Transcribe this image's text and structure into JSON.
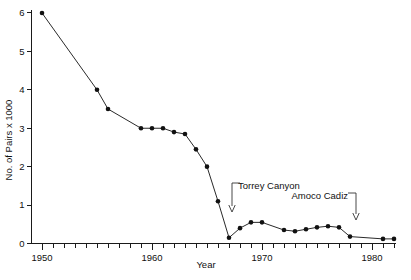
{
  "chart_data": {
    "type": "line",
    "title": "",
    "xlabel": "Year",
    "ylabel": "No. of Pairs x 1000",
    "xlim": [
      1949,
      1982.5
    ],
    "ylim": [
      0,
      6.2
    ],
    "grid": false,
    "legend": "none",
    "x_ticks_major": [
      1950,
      1960,
      1970,
      1980
    ],
    "x_tick_labels": [
      "1950",
      "1960",
      "1970",
      "1980"
    ],
    "x_tick_minor_step": 1,
    "y_ticks": [
      0,
      1,
      2,
      3,
      4,
      5,
      6
    ],
    "y_tick_labels": [
      "0",
      "1",
      "2",
      "3",
      "4",
      "5",
      "6"
    ],
    "series": [
      {
        "name": "Number of pairs",
        "marker": "filled-circle",
        "x": [
          1950,
          1955,
          1956,
          1959,
          1960,
          1961,
          1962,
          1963,
          1964,
          1965,
          1966,
          1967,
          1968,
          1969,
          1970,
          1972,
          1973,
          1974,
          1975,
          1976,
          1977,
          1978,
          1981,
          1982
        ],
        "y": [
          6.0,
          4.0,
          3.5,
          3.0,
          3.0,
          3.0,
          2.9,
          2.85,
          2.45,
          2.0,
          1.1,
          0.15,
          0.4,
          0.55,
          0.55,
          0.35,
          0.32,
          0.37,
          0.42,
          0.45,
          0.42,
          0.18,
          0.12,
          0.12
        ]
      }
    ],
    "annotations": [
      {
        "id": "torrey-canyon",
        "label": "Torrey Canyon",
        "target_year": 1967,
        "text_x": 238,
        "text_y": 189,
        "arrow_x": 232,
        "arrow_top_y": 186,
        "arrow_bottom_y": 212,
        "leader_side": "left"
      },
      {
        "id": "amoco-cadiz",
        "label": "Amoco Cadiz",
        "target_year": 1978,
        "text_x": 348,
        "text_y": 199,
        "arrow_x": 356,
        "arrow_top_y": 196,
        "arrow_bottom_y": 220,
        "leader_side": "right"
      }
    ]
  },
  "colors": {
    "line": "#2a2a2a",
    "marker": "#111111",
    "axis": "#1a1a1a",
    "background": "#ffffff",
    "annotation": "#333333"
  }
}
